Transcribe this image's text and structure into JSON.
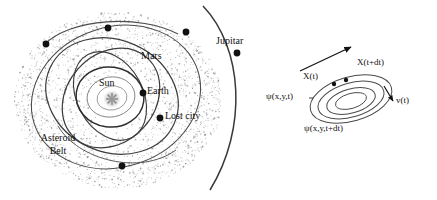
{
  "figure": {
    "panels": [
      {
        "id": "solar-system",
        "role": "solar system schematic with asteroid belt",
        "labels": {
          "sun": "Sun",
          "earth": "Earth",
          "mars": "Mars",
          "jupiter": "Jupitar",
          "lost_city": "Lost city",
          "asteroid_belt_line1": "Asteroid",
          "asteroid_belt_line2": "Belt"
        },
        "markers": [
          {
            "name": "marker-upper-left",
            "x": 46,
            "y": 44
          },
          {
            "name": "marker-top",
            "x": 108,
            "y": 28
          },
          {
            "name": "marker-mars-orbit",
            "x": 186,
            "y": 32
          },
          {
            "name": "marker-earth",
            "x": 143,
            "y": 93
          },
          {
            "name": "marker-lost-city",
            "x": 160,
            "y": 118
          },
          {
            "name": "marker-bottom",
            "x": 122,
            "y": 166
          },
          {
            "name": "marker-jupiter",
            "x": 237,
            "y": 53
          }
        ]
      },
      {
        "id": "vector-flow",
        "role": "displacement and velocity vector diagram over nested ellipses",
        "labels": {
          "x_t": "X(t)",
          "x_t_dt": "X(t+dt)",
          "psi_t": "ψ(x,y,t)",
          "psi_t_dt": "ψ(x,y,t+dt)",
          "v_t": "v(t)"
        }
      }
    ]
  },
  "colors": {
    "ink": "#111111",
    "orbit": "#333333",
    "faint_orbit": "#777777",
    "stipple": "#8a8a8a",
    "background": "#ffffff"
  }
}
